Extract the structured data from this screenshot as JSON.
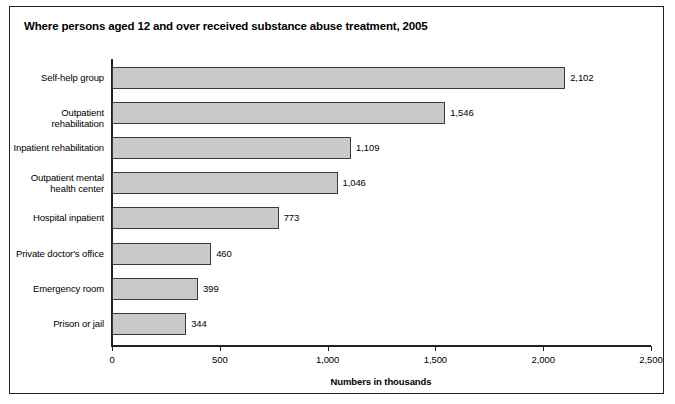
{
  "figure": {
    "title": "Where persons aged 12 and over received substance abuse treatment, 2005",
    "frame_color": "#231f20",
    "background": "#ffffff"
  },
  "chart_data": {
    "type": "bar",
    "orientation": "horizontal",
    "title": "Where persons aged 12 and over received substance abuse treatment, 2005",
    "xlabel": "Numbers in thousands",
    "ylabel": "",
    "xlim": [
      0,
      2500
    ],
    "grid": false,
    "legend": null,
    "bar_color": "#c9c9c9",
    "bar_border_color": "#3a3a3a",
    "categories": [
      "Self-help group",
      "Outpatient rehabilitation",
      "Inpatient rehabilitation",
      "Outpatient mental health center",
      "Hospital inpatient",
      "Private doctor's office",
      "Emergency room",
      "Prison or jail"
    ],
    "values": [
      2102,
      1546,
      1109,
      1046,
      773,
      460,
      399,
      344
    ],
    "value_labels": [
      "2,102",
      "1,546",
      "1,109",
      "1,046",
      "773",
      "460",
      "399",
      "344"
    ],
    "xticks": [
      0,
      500,
      1000,
      1500,
      2000,
      2500
    ],
    "xtick_labels": [
      "0",
      "500",
      "1,000",
      "1,500",
      "2,000",
      "2,500"
    ]
  },
  "bars": [
    {
      "label_line1": "Self-help group",
      "label_line2": "",
      "value_label": "2,102"
    },
    {
      "label_line1": "Outpatient rehabilitation",
      "label_line2": "",
      "value_label": "1,546"
    },
    {
      "label_line1": "Inpatient rehabilitation",
      "label_line2": "",
      "value_label": "1,109"
    },
    {
      "label_line1": "Outpatient mental",
      "label_line2": "health center",
      "value_label": "1,046"
    },
    {
      "label_line1": "Hospital inpatient",
      "label_line2": "",
      "value_label": "773"
    },
    {
      "label_line1": "Private doctor's office",
      "label_line2": "",
      "value_label": "460"
    },
    {
      "label_line1": "Emergency room",
      "label_line2": "",
      "value_label": "399"
    },
    {
      "label_line1": "Prison or jail",
      "label_line2": "",
      "value_label": "344"
    }
  ]
}
